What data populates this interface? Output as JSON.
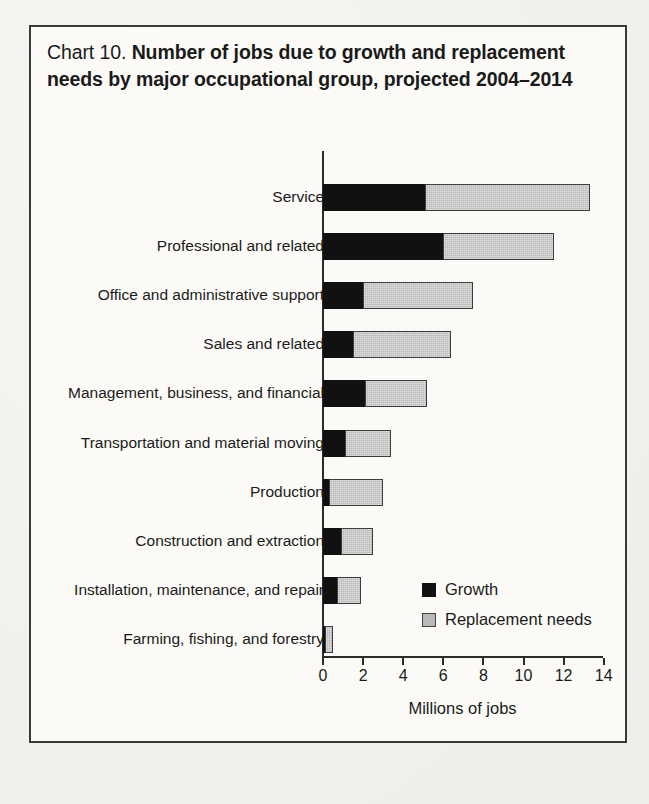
{
  "figure": {
    "label": "Chart 10.",
    "title": "Number of jobs due to growth and replacement needs by major occupational group, projected 2004–2014"
  },
  "legend": {
    "growth_label": "Growth",
    "replacement_label": "Replacement needs"
  },
  "colors": {
    "growth": "#111111",
    "replacement": "#b9b9b9",
    "axis": "#2b2b2b",
    "frame": "#3a3a3a",
    "paper": "#fbfaf6"
  },
  "chart_data": {
    "type": "bar",
    "orientation": "horizontal",
    "stacked": true,
    "title": "Chart 10. Number of jobs due to growth and replacement needs by major occupational group, projected 2004–2014",
    "xlabel": "Millions of jobs",
    "ylabel": "",
    "xlim": [
      0,
      14
    ],
    "xticks": [
      0,
      2,
      4,
      6,
      8,
      10,
      12,
      14
    ],
    "xticklabels": [
      "0",
      "2",
      "4",
      "6",
      "8",
      "10",
      "12",
      "14"
    ],
    "grid": false,
    "legend_position": "inside-lower-right",
    "categories": [
      "Service",
      "Professional and related",
      "Office and administrative support",
      "Sales and related",
      "Management, business, and financial",
      "Transportation and material moving",
      "Production",
      "Construction and extraction",
      "Installation, maintenance, and repair",
      "Farming, fishing, and forestry"
    ],
    "series": [
      {
        "name": "Growth",
        "values": [
          5.1,
          6.0,
          2.0,
          1.5,
          2.1,
          1.1,
          0.3,
          0.9,
          0.7,
          0.05
        ]
      },
      {
        "name": "Replacement needs",
        "values": [
          8.2,
          5.5,
          5.5,
          4.9,
          3.1,
          2.3,
          2.7,
          1.6,
          1.2,
          0.45
        ]
      }
    ],
    "totals": [
      13.3,
      11.5,
      7.5,
      6.4,
      5.2,
      3.4,
      3.0,
      2.5,
      1.9,
      0.5
    ]
  },
  "rows": [
    {
      "label": "Service",
      "growth": 5.1,
      "replacement": 8.2,
      "top": 157
    },
    {
      "label": "Professional and related",
      "growth": 6.0,
      "replacement": 5.5,
      "top": 206
    },
    {
      "label": "Office and administrative support",
      "growth": 2.0,
      "replacement": 5.5,
      "top": 255
    },
    {
      "label": "Sales and related",
      "growth": 1.5,
      "replacement": 4.9,
      "top": 304
    },
    {
      "label": "Management, business, and financial",
      "growth": 2.1,
      "replacement": 3.1,
      "top": 353
    },
    {
      "label": "Transportation and material moving",
      "growth": 1.1,
      "replacement": 2.3,
      "top": 403
    },
    {
      "label": "Production",
      "growth": 0.3,
      "replacement": 2.7,
      "top": 452
    },
    {
      "label": "Construction and extraction",
      "growth": 0.9,
      "replacement": 1.6,
      "top": 501
    },
    {
      "label": "Installation, maintenance, and repair",
      "growth": 0.7,
      "replacement": 1.2,
      "top": 550
    },
    {
      "label": "Farming, fishing, and forestry",
      "growth": 0.05,
      "replacement": 0.45,
      "top": 599
    }
  ]
}
